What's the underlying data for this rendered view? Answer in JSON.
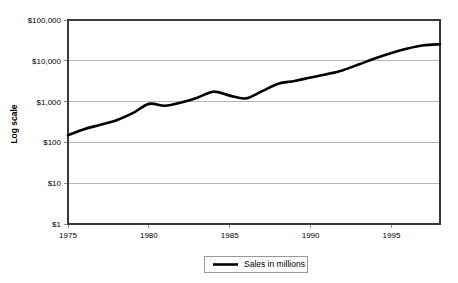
{
  "chart_data": {
    "type": "line",
    "title": "",
    "subtitle": "",
    "xlabel": "",
    "ylabel": "Log scale",
    "yscale": "log",
    "ylim": [
      1,
      100000
    ],
    "xlim": [
      1975,
      1998
    ],
    "grid": true,
    "legend_position": "bottom",
    "y_tick_labels": [
      "$100,000",
      "$10,000",
      "$1,000",
      "$100",
      "$10",
      "$1"
    ],
    "y_tick_values": [
      100000,
      10000,
      1000,
      100,
      10,
      1
    ],
    "x_tick_labels": [
      "1975",
      "1980",
      "1985",
      "1990",
      "1995"
    ],
    "x_tick_values": [
      1975,
      1980,
      1985,
      1990,
      1995
    ],
    "x": [
      1975,
      1976,
      1977,
      1978,
      1979,
      1980,
      1981,
      1982,
      1983,
      1984,
      1985,
      1986,
      1987,
      1988,
      1989,
      1990,
      1991,
      1992,
      1993,
      1994,
      1995,
      1996,
      1997,
      1998
    ],
    "series": [
      {
        "name": "Sales in millions",
        "color": "#000000",
        "values": [
          150,
          210,
          270,
          350,
          520,
          880,
          790,
          950,
          1250,
          1750,
          1400,
          1200,
          1800,
          2750,
          3200,
          3900,
          4700,
          5900,
          8200,
          11500,
          15500,
          20000,
          24000,
          25500
        ]
      }
    ],
    "legend": [
      {
        "label": "Sales in millions",
        "color": "#000000",
        "marker": "line"
      }
    ]
  },
  "axis": {
    "y_title": "Log scale"
  },
  "colors": {
    "series": "#000000",
    "gridline": "#a6a6a6",
    "axis": "#3a3a3a",
    "background": "#ffffff"
  }
}
